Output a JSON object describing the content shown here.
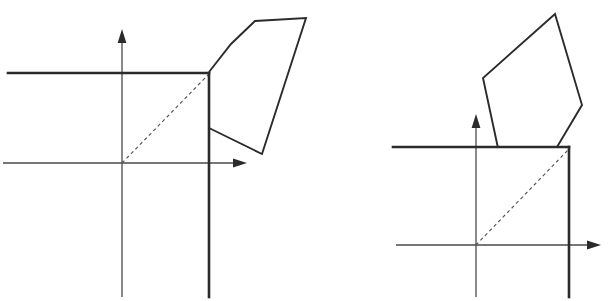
{
  "figure": {
    "canvas": {
      "width": 609,
      "height": 301,
      "background": "#ffffff"
    },
    "colors": {
      "axis": "#4a4a4a",
      "arrowhead": "#2b2b2b",
      "thick_boundary": "#2b2b2b",
      "dashed_diagonal": "#555555",
      "polygon_outline": "#2b2b2b"
    },
    "panels": [
      {
        "id": "left-panel",
        "name": "before-rotation",
        "axes": {
          "origin": {
            "x": 122,
            "y": 163
          },
          "x_axis": {
            "x_start": 3,
            "x_end": 247,
            "y": 163,
            "arrow_at": "right",
            "arrow_tip_x": 247
          },
          "y_axis": {
            "x": 122,
            "y_start": 297,
            "y_end": 29,
            "arrow_at": "top",
            "arrow_tip_y": 29
          }
        },
        "boundary": {
          "description": "thick horizontal ray meeting a thick vertical ray at the corner",
          "corner": {
            "x": 209,
            "y": 73
          },
          "horizontal": {
            "x_start": 8,
            "x_end": 209,
            "y": 73
          },
          "vertical": {
            "x": 209,
            "y_start": 73,
            "y_end": 297
          }
        },
        "dashed_diagonal": {
          "x1": 122,
          "y1": 163,
          "x2": 209,
          "y2": 74
        },
        "polygon": {
          "name": "pentagon-before",
          "sides": 5,
          "vertices": [
            {
              "x": 209,
              "y": 72
            },
            {
              "x": 231,
              "y": 44
            },
            {
              "x": 255,
              "y": 21
            },
            {
              "x": 306,
              "y": 18
            },
            {
              "x": 262,
              "y": 154
            },
            {
              "x": 209,
              "y": 128
            }
          ]
        }
      },
      {
        "id": "right-panel",
        "name": "after-rotation",
        "axes": {
          "origin": {
            "x": 476,
            "y": 245
          },
          "x_axis": {
            "x_start": 396,
            "x_end": 601,
            "y": 245,
            "arrow_at": "right",
            "arrow_tip_x": 601
          },
          "y_axis": {
            "x": 476,
            "y_start": 297,
            "y_end": 114,
            "arrow_at": "top",
            "arrow_tip_y": 114
          }
        },
        "boundary": {
          "description": "thick horizontal ray meeting a thick vertical ray at the corner",
          "corner": {
            "x": 569,
            "y": 147
          },
          "horizontal": {
            "x_start": 393,
            "x_end": 569,
            "y": 147
          },
          "vertical": {
            "x": 569,
            "y_start": 147,
            "y_end": 297
          }
        },
        "dashed_diagonal": {
          "x1": 476,
          "y1": 245,
          "x2": 569,
          "y2": 149
        },
        "polygon": {
          "name": "pentagon-after",
          "sides": 5,
          "vertices": [
            {
              "x": 498,
              "y": 148
            },
            {
              "x": 483,
              "y": 78
            },
            {
              "x": 555,
              "y": 14
            },
            {
              "x": 582,
              "y": 105
            },
            {
              "x": 557,
              "y": 147
            }
          ]
        }
      }
    ]
  }
}
